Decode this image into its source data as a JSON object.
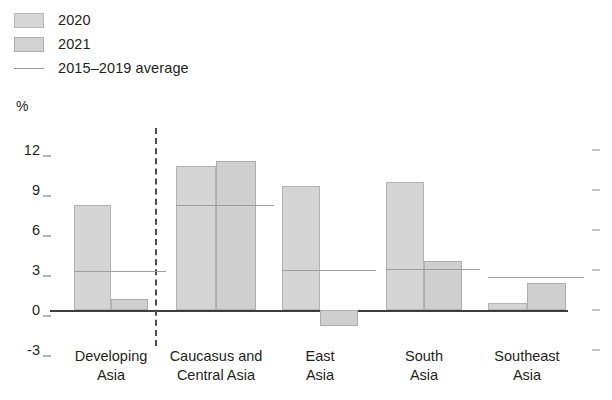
{
  "legend": {
    "items": [
      {
        "label": "2020",
        "marker": "swatch-2020"
      },
      {
        "label": "2021",
        "marker": "swatch-2021"
      },
      {
        "label": "2015–2019 average",
        "marker": "average-line"
      }
    ]
  },
  "chart_data": {
    "type": "bar",
    "title": "",
    "subtitle": "",
    "xlabel": "",
    "ylabel": "%",
    "ylim": [
      -3,
      12
    ],
    "yticks": [
      12,
      9,
      6,
      3,
      0,
      -3
    ],
    "ytick_labels": [
      "12",
      "9",
      "6",
      "3",
      "0",
      "-3"
    ],
    "grid": false,
    "legend_position": "top-left",
    "categories": [
      "Developing\nAsia",
      "Caucasus and\nCentral Asia",
      "East\nAsia",
      "South\nAsia",
      "Southeast\nAsia"
    ],
    "series": [
      {
        "name": "2020",
        "values": [
          7.9,
          10.8,
          9.3,
          9.6,
          0.5
        ]
      },
      {
        "name": "2021",
        "values": [
          0.8,
          11.2,
          -1.2,
          3.7,
          2.0
        ]
      }
    ],
    "reference_series": {
      "name": "2015–2019 average",
      "values": [
        2.9,
        7.9,
        3.0,
        3.1,
        2.5
      ]
    },
    "annotations": [
      {
        "type": "vertical-dashed-divider",
        "after_category": "Developing\nAsia"
      }
    ],
    "axis_ticks_mirrored_right": true
  }
}
